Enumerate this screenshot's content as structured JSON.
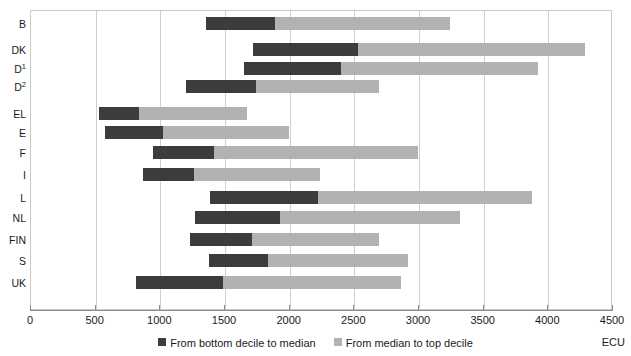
{
  "chart_data": {
    "type": "bar",
    "orientation": "horizontal",
    "subtype": "stacked-range",
    "title": "",
    "subtitle": "",
    "xlabel": "",
    "ylabel": "",
    "unit_label": "ECU",
    "xlim": [
      0,
      4500
    ],
    "xticks": [
      0,
      500,
      1000,
      1500,
      2000,
      2500,
      3000,
      3500,
      4000,
      4500
    ],
    "xticklabels": [
      "0",
      "500",
      "1000",
      "1500",
      "2000",
      "2500",
      "3000",
      "3500",
      "4000",
      "4500"
    ],
    "grid": true,
    "grid_axis": "x",
    "legend_position": "bottom",
    "legend": [
      {
        "name": "From bottom decile to median",
        "color": "#3c3c3c"
      },
      {
        "name": "From median to top decile",
        "color": "#b2b2b2"
      }
    ],
    "categories": [
      "B",
      "DK",
      "D1",
      "D2",
      "EL",
      "E",
      "F",
      "I",
      "L",
      "NL",
      "FIN",
      "S",
      "UK"
    ],
    "category_labels": [
      "B",
      "DK",
      "D",
      "D",
      "EL",
      "E",
      "F",
      "I",
      "L",
      "NL",
      "FIN",
      "S",
      "UK"
    ],
    "category_superscripts": [
      "",
      "",
      "1",
      "2",
      "",
      "",
      "",
      "",
      "",
      "",
      "",
      "",
      ""
    ],
    "series": [
      {
        "name": "Bottom decile",
        "values": [
          1360,
          1725,
          1655,
          1205,
          535,
          580,
          950,
          875,
          1390,
          1275,
          1240,
          1385,
          820
        ]
      },
      {
        "name": "Median",
        "values": [
          1895,
          2535,
          2405,
          1750,
          845,
          1030,
          1425,
          1270,
          2225,
          1935,
          1715,
          1840,
          1490
        ]
      },
      {
        "name": "Top decile",
        "values": [
          3250,
          4290,
          3930,
          2700,
          1680,
          2000,
          3000,
          2240,
          3880,
          3325,
          2700,
          2925,
          2870
        ]
      }
    ],
    "rows": [
      {
        "category": "B",
        "sup": "",
        "bottom_decile": 1360,
        "median": 1895,
        "top_decile": 3250
      },
      {
        "category": "DK",
        "sup": "",
        "bottom_decile": 1725,
        "median": 2535,
        "top_decile": 4290
      },
      {
        "category": "D",
        "sup": "1",
        "bottom_decile": 1655,
        "median": 2405,
        "top_decile": 3930
      },
      {
        "category": "D",
        "sup": "2",
        "bottom_decile": 1205,
        "median": 1750,
        "top_decile": 2700
      },
      {
        "category": "EL",
        "sup": "",
        "bottom_decile": 535,
        "median": 845,
        "top_decile": 1680
      },
      {
        "category": "E",
        "sup": "",
        "bottom_decile": 580,
        "median": 1030,
        "top_decile": 2000
      },
      {
        "category": "F",
        "sup": "",
        "bottom_decile": 950,
        "median": 1425,
        "top_decile": 3000
      },
      {
        "category": "I",
        "sup": "",
        "bottom_decile": 875,
        "median": 1270,
        "top_decile": 2240
      },
      {
        "category": "L",
        "sup": "",
        "bottom_decile": 1390,
        "median": 2225,
        "top_decile": 3880
      },
      {
        "category": "NL",
        "sup": "",
        "bottom_decile": 1275,
        "median": 1935,
        "top_decile": 3325
      },
      {
        "category": "FIN",
        "sup": "",
        "bottom_decile": 1240,
        "median": 1715,
        "top_decile": 2700
      },
      {
        "category": "S",
        "sup": "",
        "bottom_decile": 1385,
        "median": 1840,
        "top_decile": 2925
      },
      {
        "category": "UK",
        "sup": "",
        "bottom_decile": 820,
        "median": 1490,
        "top_decile": 2870
      }
    ]
  },
  "colors": {
    "low": "#3c3c3c",
    "high": "#b2b2b2",
    "grid": "#cfcfcf",
    "axis": "#8a8a8a",
    "text": "#1a1a1a",
    "background": "#ffffff"
  }
}
